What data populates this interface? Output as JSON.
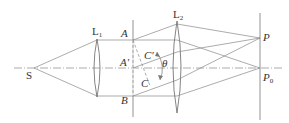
{
  "diagram": {
    "type": "optics-ray-diagram",
    "labels": {
      "source": "S",
      "lens1": "L",
      "lens1_sub": "1",
      "lens2": "L",
      "lens2_sub": "2",
      "point_A": "A",
      "point_A_prime": "A′",
      "point_B": "B",
      "point_C": "C",
      "point_C_prime": "C′",
      "angle": "θ",
      "point_P": "P",
      "point_P0": "P",
      "point_P0_sub": "0"
    },
    "colors": {
      "line": "#777777",
      "lens": "#666666",
      "text": "#333333"
    }
  }
}
